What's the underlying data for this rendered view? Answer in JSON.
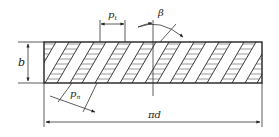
{
  "diagram": {
    "type": "helical-gear-tooth-development",
    "labels": {
      "face_width": "b",
      "transverse_pitch": "p",
      "transverse_pitch_sub": "t",
      "normal_pitch": "p",
      "normal_pitch_sub": "n",
      "helix_angle": "β",
      "circumference": "πd"
    },
    "colors": {
      "line": "#222222",
      "hatch": "#555555",
      "background": "#ffffff"
    }
  }
}
